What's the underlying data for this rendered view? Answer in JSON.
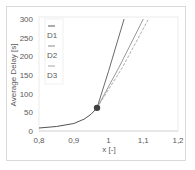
{
  "chart_data": {
    "type": "line",
    "title": "",
    "xlabel": "x  [-]",
    "ylabel": "Average Delay [s]",
    "xlim": [
      0.8,
      1.2
    ],
    "ylim": [
      0,
      300
    ],
    "x_ticks": [
      "0,8",
      "0,9",
      "1",
      "1,1",
      "1,2"
    ],
    "y_ticks": [
      "0",
      "50",
      "100",
      "150",
      "200",
      "250",
      "300"
    ],
    "grid": false,
    "legend_position": "upper-left-inside",
    "series": [
      {
        "name": "base",
        "x": [
          0.8,
          0.85,
          0.9,
          0.93,
          0.95,
          0.967
        ],
        "y": [
          8,
          12,
          20,
          32,
          45,
          62
        ],
        "color": "#404040",
        "style": "solid"
      },
      {
        "name": "D1",
        "x": [
          0.967,
          1.0,
          1.045
        ],
        "y": [
          62,
          160,
          300
        ],
        "color": "#595959",
        "style": "solid"
      },
      {
        "name": "D2",
        "x": [
          0.967,
          1.03,
          1.1
        ],
        "y": [
          62,
          170,
          300
        ],
        "color": "#8c8c8c",
        "style": "solid"
      },
      {
        "name": "D3",
        "x": [
          0.967,
          1.04,
          1.115
        ],
        "y": [
          62,
          170,
          300
        ],
        "color": "#a6a6a6",
        "style": "dashed"
      }
    ],
    "markers": [
      {
        "x": 0.967,
        "y": 62,
        "shape": "circle",
        "color": "#404040"
      }
    ]
  },
  "legend": {
    "items": [
      {
        "label": "D1",
        "color": "#595959"
      },
      {
        "label": "D2",
        "color": "#8c8c8c"
      },
      {
        "label": "D3",
        "color": "#a6a6a6"
      }
    ]
  }
}
